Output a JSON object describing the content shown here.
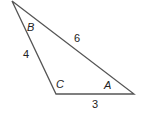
{
  "diagram": {
    "type": "triangle",
    "vertices": [
      {
        "name": "B",
        "x": 12,
        "y": 1
      },
      {
        "name": "C",
        "x": 56,
        "y": 94
      },
      {
        "name": "A",
        "x": 134,
        "y": 94
      }
    ],
    "angle_labels": {
      "B": "B",
      "C": "C",
      "A": "A"
    },
    "side_labels": {
      "BC": "4",
      "BA": "6",
      "CA": "3"
    },
    "stroke_color": "#555555"
  }
}
